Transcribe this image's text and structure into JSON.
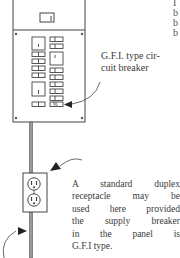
{
  "figure": {
    "colors": {
      "ink": "#333333",
      "background": "#ffffff"
    }
  },
  "labels": {
    "gfi_breaker": [
      "G.F.I. type cir-",
      "cuit breaker"
    ],
    "receptacle_note": [
      "A standard duplex",
      "receptacle may be",
      "used here provided",
      "the supply breaker",
      "in the panel is",
      "G.F.I type."
    ],
    "cropped_edge_text": [
      "I",
      "b",
      "b",
      "b"
    ]
  },
  "components": {
    "panel": "electrical-panel",
    "breakers_left_column": 8,
    "breakers_right_column": 9,
    "gfi_breaker_mark": "%",
    "receptacle": "duplex-receptacle",
    "conduit": "conduit"
  }
}
